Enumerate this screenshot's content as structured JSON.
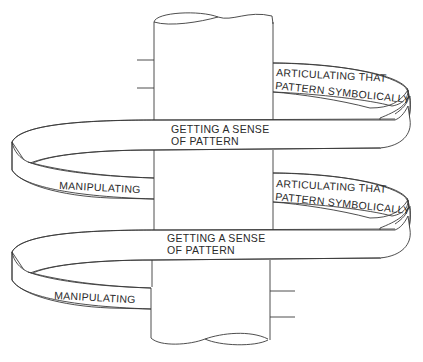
{
  "diagram": {
    "type": "spiral-around-pole",
    "pole": {
      "label": ""
    },
    "spirals": [
      {
        "articulating_line1": "ARTICULATING THAT",
        "articulating_line2": "PATTERN SYMBOLICALLY",
        "sense_line1": "GETTING A SENSE",
        "sense_line2": "OF PATTERN",
        "manipulating": "MANIPULATING"
      },
      {
        "articulating_line1": "ARTICULATING THAT",
        "articulating_line2": "PATTERN SYMBOLICALLY",
        "sense_line1": "GETTING A SENSE",
        "sense_line2": "OF PATTERN",
        "manipulating": "MANIPULATING"
      }
    ],
    "colors": {
      "line": "#3a3a3a",
      "text": "#2a2a2a",
      "background": "#ffffff"
    }
  }
}
